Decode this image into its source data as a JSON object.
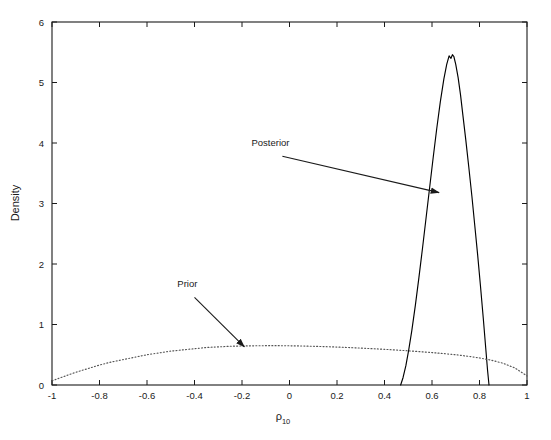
{
  "chart_data": {
    "type": "line",
    "title": "",
    "xlabel": "ρ₁₀",
    "xlabel_base": "ρ",
    "xlabel_sub": "10",
    "ylabel": "Density",
    "xlim": [
      -1,
      1
    ],
    "ylim": [
      0,
      6
    ],
    "grid": false,
    "legend_position": "none",
    "xticks": [
      -1,
      -0.8,
      -0.6,
      -0.4,
      -0.2,
      0,
      0.2,
      0.4,
      0.6,
      0.8,
      1
    ],
    "xticklabels": [
      "-1",
      "-0.8",
      "-0.6",
      "-0.4",
      "-0.2",
      "0",
      "0.2",
      "0.4",
      "0.6",
      "0.8",
      "1"
    ],
    "yticks": [
      0,
      1,
      2,
      3,
      4,
      5,
      6
    ],
    "yticklabels": [
      "0",
      "1",
      "2",
      "3",
      "4",
      "5",
      "6"
    ],
    "annotations": [
      {
        "text": "Posterior",
        "label_x": -0.08,
        "label_y": 3.95,
        "arrow_from_x": -0.03,
        "arrow_from_y": 3.78,
        "arrow_to_x": 0.63,
        "arrow_to_y": 3.18
      },
      {
        "text": "Prior",
        "label_x": -0.43,
        "label_y": 1.62,
        "arrow_from_x": -0.4,
        "arrow_from_y": 1.45,
        "arrow_to_x": -0.19,
        "arrow_to_y": 0.63
      }
    ],
    "series": [
      {
        "name": "Posterior",
        "style": "solid",
        "color": "#000000",
        "x": [
          0.468,
          0.478,
          0.49,
          0.502,
          0.515,
          0.53,
          0.545,
          0.56,
          0.575,
          0.59,
          0.605,
          0.62,
          0.635,
          0.65,
          0.662,
          0.672,
          0.68,
          0.686,
          0.692,
          0.7,
          0.71,
          0.72,
          0.73,
          0.742,
          0.755,
          0.768,
          0.78,
          0.792,
          0.804,
          0.816,
          0.826,
          0.834,
          0.84
        ],
        "y": [
          0.0,
          0.12,
          0.32,
          0.58,
          0.9,
          1.32,
          1.78,
          2.26,
          2.76,
          3.26,
          3.76,
          4.24,
          4.68,
          5.06,
          5.3,
          5.44,
          5.4,
          5.46,
          5.43,
          5.3,
          5.08,
          4.8,
          4.46,
          4.06,
          3.6,
          3.12,
          2.64,
          2.16,
          1.64,
          1.1,
          0.62,
          0.24,
          0.0
        ]
      },
      {
        "name": "Prior",
        "style": "dotted",
        "color": "#555555",
        "x": [
          -1.0,
          -0.95,
          -0.9,
          -0.85,
          -0.8,
          -0.75,
          -0.7,
          -0.65,
          -0.6,
          -0.55,
          -0.5,
          -0.45,
          -0.4,
          -0.35,
          -0.3,
          -0.25,
          -0.2,
          -0.15,
          -0.1,
          -0.05,
          0.0,
          0.05,
          0.1,
          0.15,
          0.2,
          0.25,
          0.3,
          0.35,
          0.4,
          0.45,
          0.5,
          0.55,
          0.6,
          0.65,
          0.7,
          0.75,
          0.8,
          0.85,
          0.9,
          0.95,
          1.0
        ],
        "y": [
          0.07,
          0.14,
          0.21,
          0.27,
          0.33,
          0.38,
          0.42,
          0.46,
          0.5,
          0.53,
          0.56,
          0.58,
          0.6,
          0.62,
          0.63,
          0.64,
          0.645,
          0.648,
          0.65,
          0.65,
          0.648,
          0.645,
          0.64,
          0.634,
          0.627,
          0.619,
          0.61,
          0.6,
          0.59,
          0.578,
          0.565,
          0.551,
          0.536,
          0.519,
          0.5,
          0.476,
          0.447,
          0.41,
          0.358,
          0.28,
          0.15
        ]
      }
    ]
  },
  "axes": {
    "y_axis_title": "Density",
    "x_axis_title_base": "ρ",
    "x_axis_title_sub": "10"
  }
}
